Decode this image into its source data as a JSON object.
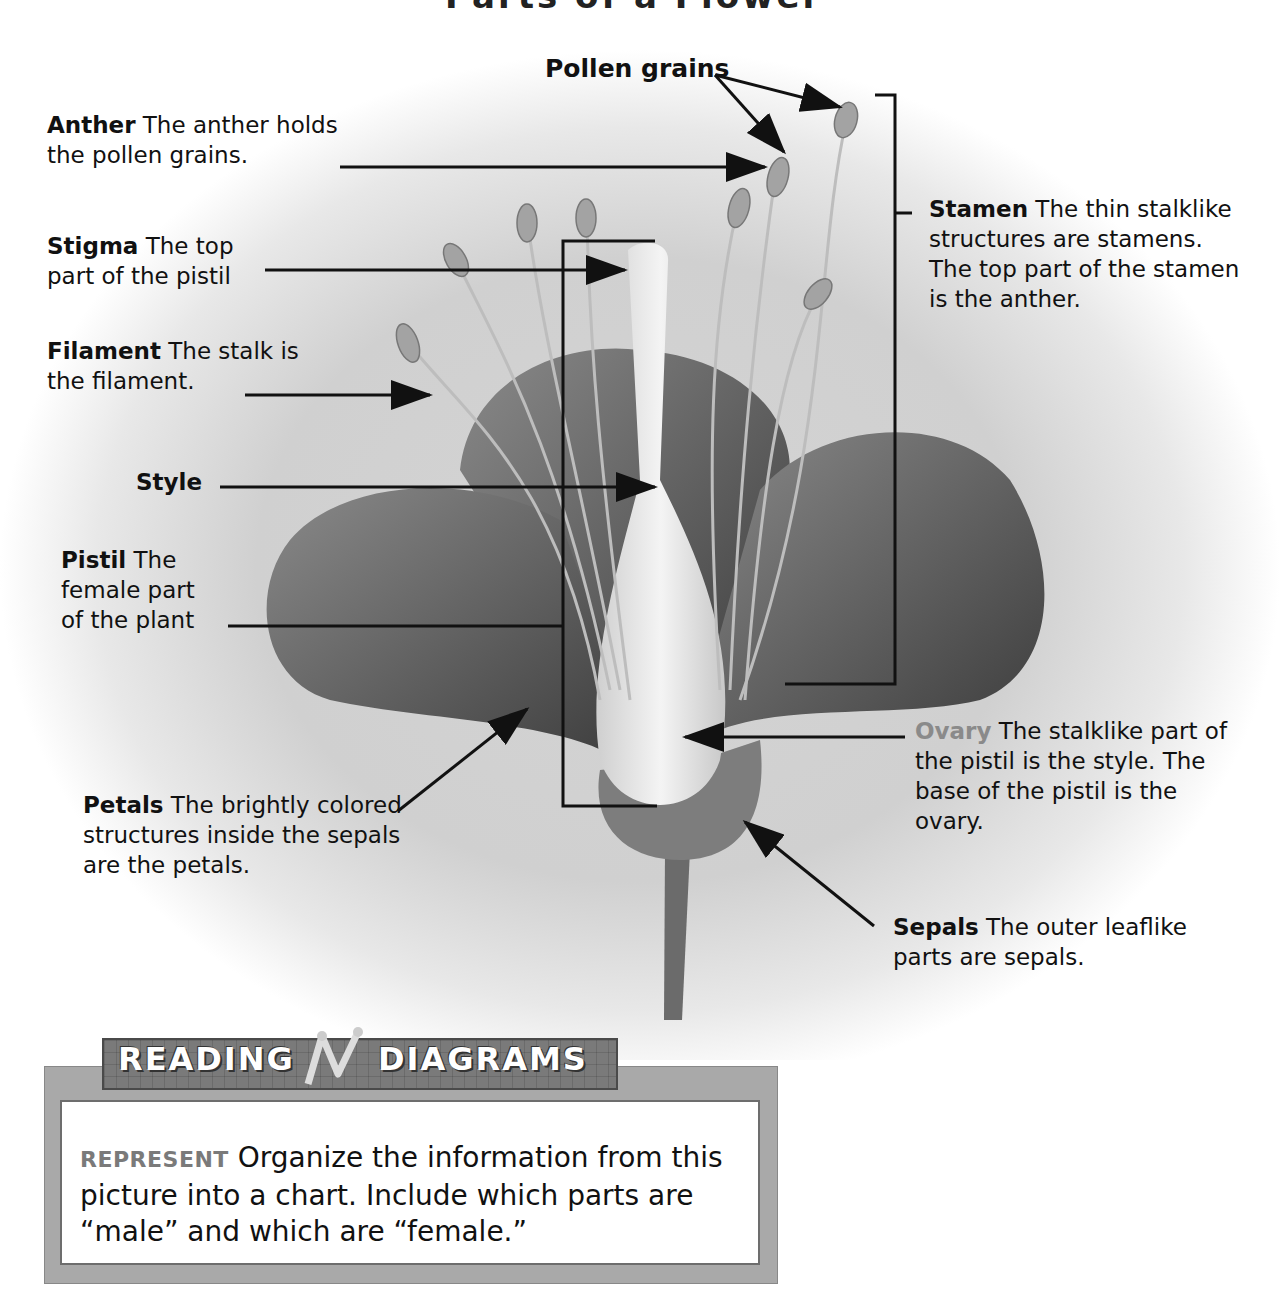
{
  "title": "Parts of a Flower",
  "labels": {
    "pollen": {
      "term": "Pollen grains",
      "desc": ""
    },
    "anther": {
      "term": "Anther",
      "desc": "The anther holds the pollen grains."
    },
    "stigma": {
      "term": "Stigma",
      "desc": "The top part of the pistil"
    },
    "filament": {
      "term": "Filament",
      "desc": "The stalk is the filament."
    },
    "style": {
      "term": "Style",
      "desc": ""
    },
    "pistil": {
      "term": "Pistil",
      "desc": "The female part of the plant"
    },
    "petals": {
      "term": "Petals",
      "desc": "The brightly colored structures inside the sepals are the petals."
    },
    "stamen": {
      "term": "Stamen",
      "desc": "The thin stalklike structures are stamens. The top part of the stamen is the anther."
    },
    "ovary": {
      "term": "Ovary",
      "desc": "The stalklike part of the pistil is the style. The base of the pistil is the ovary."
    },
    "sepals": {
      "term": "Sepals",
      "desc": "The outer leaflike parts are sepals."
    }
  },
  "reading_box": {
    "banner_left": "READING",
    "banner_right": "DIAGRAMS",
    "keyword": "REPRESENT",
    "text": "Organize the information from this picture into a chart. Include which parts are “male” and which are “female.”"
  }
}
